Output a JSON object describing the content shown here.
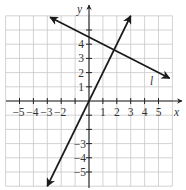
{
  "chart_data": {
    "type": "line",
    "title": "",
    "xlabel": "x",
    "ylabel": "y",
    "xlim": [
      -6,
      6
    ],
    "ylim": [
      -6,
      6
    ],
    "grid": true,
    "x_ticks": [
      -5,
      -4,
      -3,
      -2,
      -1,
      1,
      2,
      3,
      4,
      5
    ],
    "y_ticks": [
      -5,
      -4,
      -3,
      -2,
      -1,
      1,
      2,
      3,
      4,
      5
    ],
    "x_tick_labels": [
      "−5",
      "−4",
      "−3",
      "−2",
      "1",
      "2",
      "3",
      "4",
      "5"
    ],
    "y_tick_labels": [
      "5",
      "4",
      "3",
      "2",
      "1",
      "−3",
      "−4",
      "−5"
    ],
    "series": [
      {
        "name": "l",
        "equation": "y = -x/2 + 4.5",
        "slope": -0.5,
        "intercept": 4.5,
        "x": [
          -2.8,
          5.8
        ],
        "y": [
          5.9,
          1.6
        ],
        "arrows": "both"
      },
      {
        "name": "line through origin",
        "equation": "y = 2x",
        "slope": 2,
        "intercept": 0,
        "x": [
          -3.0,
          3.0
        ],
        "y": [
          -6.0,
          6.0
        ],
        "arrows": "both"
      }
    ],
    "annotations": [
      {
        "text": "l",
        "x": 4.5,
        "y": 1.5
      },
      {
        "text": "intersection",
        "x": 1.8,
        "y": 3.6
      }
    ]
  },
  "labels": {
    "x_axis": "x",
    "y_axis": "y",
    "line_l": "l",
    "x_neg": [
      "−5",
      "−4",
      "−3",
      "−2"
    ],
    "x_pos": [
      "1",
      "2",
      "3",
      "4",
      "5"
    ],
    "y_pos": [
      "4",
      "3",
      "2",
      "1"
    ],
    "y_neg": [
      "−3",
      "−4",
      "−5"
    ]
  }
}
